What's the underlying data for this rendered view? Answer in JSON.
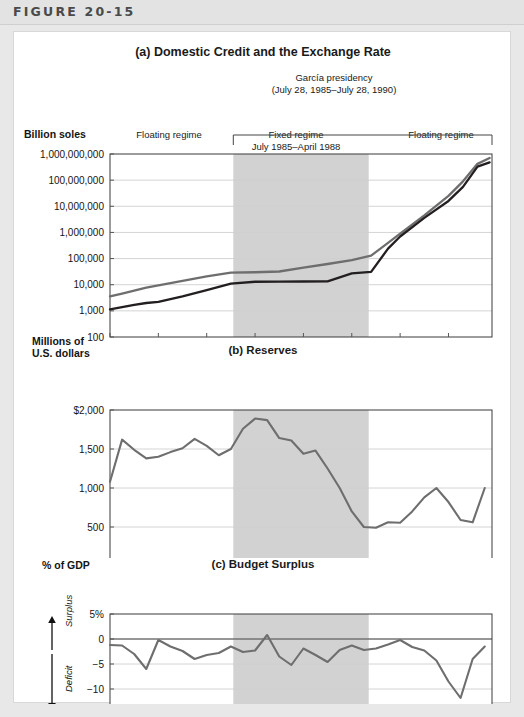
{
  "header": {
    "figure_label": "FIGURE 20-15"
  },
  "panel_a": {
    "title": "(a) Domestic Credit and the Exchange Rate",
    "bracket_note_line1": "García presidency",
    "bracket_note_line2": "(July 28, 1985–July 28, 1990)",
    "y_axis_label": "Billion soles",
    "regime_left": "Floating regime",
    "regime_mid_line1": "Fixed regime",
    "regime_mid_line2": "July 1985–April 1988",
    "regime_mid_line3": "(with some realignments)",
    "regime_right": "Floating regime",
    "series_label_credit": "Domestic credit",
    "series_label_exrate": "Exchange rate (per $)",
    "y_ticks": [
      "1,000,000,000",
      "100,000,000",
      "10,000,000",
      "1,000,000",
      "100,000",
      "10,000",
      "1,000",
      "100"
    ],
    "x_ticks": [
      "1983",
      "1984",
      "1985",
      "1986",
      "1987",
      "1988",
      "1989",
      "1990"
    ]
  },
  "panel_b": {
    "title": "(b) Reserves",
    "y_axis_label_line1": "Millions of",
    "y_axis_label_line2": "U.S. dollars",
    "y_ticks": [
      "$2,000",
      "1,500",
      "1,000",
      "500",
      "0"
    ],
    "x_ticks": [
      "1983",
      "1984",
      "1985",
      "1986",
      "1987",
      "1988",
      "1989",
      "1990"
    ]
  },
  "panel_c": {
    "title": "(c) Budget Surplus",
    "y_axis_label": "% of GDP",
    "surplus_label": "Surplus",
    "deficit_label": "Deficit",
    "y_ticks": [
      "5%",
      "0",
      "−5",
      "−10",
      "−15"
    ],
    "x_ticks": [
      "1983",
      "1984",
      "1985",
      "1986",
      "1987",
      "1988",
      "1989",
      "1990"
    ]
  },
  "colors": {
    "shade_band": "#d2d2d2",
    "line_dark": "#231f20",
    "line_gray": "#6e6e6e",
    "grid": "#cfcfcf",
    "axis": "#3a3a3a",
    "header_text": "#4a4a4a",
    "page_bg": "#e8e8e8"
  },
  "chart_data": [
    {
      "type": "line",
      "id": "panel-a",
      "title": "(a) Domestic Credit and the Exchange Rate",
      "xlabel": "",
      "ylabel": "Billion soles",
      "yscale": "log",
      "ylim": [
        100,
        1000000000
      ],
      "ytick_values": [
        1000000000,
        100000000,
        10000000,
        1000000,
        100000,
        10000,
        1000,
        100
      ],
      "ytick_labels": [
        "1,000,000,000",
        "100,000,000",
        "10,000,000",
        "1,000,000",
        "100,000",
        "10,000",
        "1,000",
        "100"
      ],
      "xlim": [
        1983.0,
        1990.9
      ],
      "xtick_values": [
        1983,
        1984,
        1985,
        1986,
        1987,
        1988,
        1989,
        1990
      ],
      "xtick_labels": [
        "1983",
        "1984",
        "1985",
        "1986",
        "1987",
        "1988",
        "1989",
        "1990"
      ],
      "grid": "horizontal",
      "shaded_span": {
        "label": "Fixed regime",
        "x0": 1985.55,
        "x1": 1988.35,
        "color": "#d2d2d2"
      },
      "annotations": [
        {
          "text": "Floating regime",
          "x": 1984.3,
          "y": 400000000
        },
        {
          "text": "Fixed regime",
          "x": 1986.95,
          "y": 400000000
        },
        {
          "text": "July 1985–April 1988",
          "x": 1986.95,
          "y": 150000000
        },
        {
          "text": "(with some realignments)",
          "x": 1986.95,
          "y": 55000000
        },
        {
          "text": "Floating regime",
          "x": 1989.85,
          "y": 400000000
        },
        {
          "text": "Domestic credit",
          "x": 1986.9,
          "y": 130000
        },
        {
          "text": "Exchange rate (per $)",
          "x": 1986.9,
          "y": 6500
        },
        {
          "text": "García presidency",
          "x": 1987.1,
          "y": 2500000000
        },
        {
          "text": "(July 28, 1985–July 28, 1990)",
          "x": 1987.1,
          "y": 1600000000
        }
      ],
      "series": [
        {
          "name": "Domestic credit",
          "color": "#6e6e6e",
          "x": [
            1983.0,
            1983.25,
            1983.5,
            1983.75,
            1984.0,
            1984.5,
            1985.0,
            1985.5,
            1986.0,
            1986.5,
            1987.0,
            1987.5,
            1988.0,
            1988.4,
            1988.75,
            1989.0,
            1989.5,
            1990.0,
            1990.3,
            1990.6,
            1990.85
          ],
          "y": [
            3600,
            4600,
            6000,
            7800,
            9500,
            14000,
            21000,
            29000,
            30000,
            32000,
            45000,
            62000,
            88000,
            130000,
            400000,
            900000,
            4500000,
            25000000,
            90000000,
            420000000,
            700000000
          ]
        },
        {
          "name": "Exchange rate (per $)",
          "color": "#231f20",
          "x": [
            1983.0,
            1983.25,
            1983.5,
            1983.75,
            1984.0,
            1984.5,
            1985.0,
            1985.5,
            1986.0,
            1986.5,
            1987.0,
            1987.5,
            1988.0,
            1988.4,
            1988.75,
            1989.0,
            1989.5,
            1990.0,
            1990.3,
            1990.6,
            1990.85
          ],
          "y": [
            1150,
            1400,
            1700,
            2000,
            2200,
            3600,
            6200,
            11000,
            13000,
            13200,
            13300,
            13400,
            27000,
            31000,
            240000,
            700000,
            3600000,
            16000000,
            55000000,
            330000000,
            480000000
          ]
        }
      ]
    },
    {
      "type": "line",
      "id": "panel-b",
      "title": "(b) Reserves",
      "xlabel": "",
      "ylabel": "Millions of U.S. dollars",
      "yscale": "linear",
      "ylim": [
        0,
        2000
      ],
      "ytick_values": [
        2000,
        1500,
        1000,
        500,
        0
      ],
      "ytick_labels": [
        "$2,000",
        "1,500",
        "1,000",
        "500",
        "0"
      ],
      "xlim": [
        1983.0,
        1990.9
      ],
      "xtick_values": [
        1983,
        1984,
        1985,
        1986,
        1987,
        1988,
        1989,
        1990
      ],
      "xtick_labels": [
        "1983",
        "1984",
        "1985",
        "1986",
        "1987",
        "1988",
        "1989",
        "1990"
      ],
      "grid": "horizontal",
      "shaded_span": {
        "x0": 1985.55,
        "x1": 1988.35,
        "color": "#d2d2d2"
      },
      "series": [
        {
          "name": "Reserves",
          "color": "#6e6e6e",
          "x": [
            1983.0,
            1983.25,
            1983.5,
            1983.75,
            1984.0,
            1984.25,
            1984.5,
            1984.75,
            1985.0,
            1985.25,
            1985.5,
            1985.75,
            1986.0,
            1986.25,
            1986.5,
            1986.75,
            1987.0,
            1987.25,
            1987.5,
            1987.75,
            1988.0,
            1988.25,
            1988.5,
            1988.75,
            1989.0,
            1989.25,
            1989.5,
            1989.75,
            1990.0,
            1990.25,
            1990.5,
            1990.75
          ],
          "y": [
            1080,
            1620,
            1490,
            1380,
            1400,
            1460,
            1510,
            1630,
            1540,
            1420,
            1500,
            1760,
            1890,
            1870,
            1640,
            1610,
            1440,
            1480,
            1250,
            1000,
            700,
            500,
            490,
            560,
            555,
            700,
            880,
            1000,
            820,
            590,
            560,
            1000,
            1040
          ]
        }
      ]
    },
    {
      "type": "line",
      "id": "panel-c",
      "title": "(c) Budget Surplus",
      "xlabel": "",
      "ylabel": "% of GDP",
      "yscale": "linear",
      "ylim": [
        -15,
        5
      ],
      "ytick_values": [
        5,
        0,
        -5,
        -10,
        -15
      ],
      "ytick_labels": [
        "5%",
        "0",
        "−5",
        "−10",
        "−15"
      ],
      "xlim": [
        1983.0,
        1990.9
      ],
      "xtick_values": [
        1983,
        1984,
        1985,
        1986,
        1987,
        1988,
        1989,
        1990
      ],
      "xtick_labels": [
        "1983",
        "1984",
        "1985",
        "1986",
        "1987",
        "1988",
        "1989",
        "1990"
      ],
      "grid": "horizontal",
      "zero_line": true,
      "shaded_span": {
        "x0": 1985.55,
        "x1": 1988.35,
        "color": "#d2d2d2"
      },
      "axis_annotations": [
        {
          "text": "Surplus",
          "direction": "up"
        },
        {
          "text": "Deficit",
          "direction": "down"
        }
      ],
      "series": [
        {
          "name": "Budget surplus (% of GDP)",
          "color": "#6e6e6e",
          "x": [
            1983.0,
            1983.25,
            1983.5,
            1983.75,
            1984.0,
            1984.25,
            1984.5,
            1984.75,
            1985.0,
            1985.25,
            1985.5,
            1985.75,
            1986.0,
            1986.25,
            1986.5,
            1986.75,
            1987.0,
            1987.25,
            1987.5,
            1987.75,
            1988.0,
            1988.25,
            1988.5,
            1988.75,
            1989.0,
            1989.25,
            1989.5,
            1989.75,
            1990.0,
            1990.25,
            1990.5,
            1990.75
          ],
          "y": [
            -1.2,
            -1.3,
            -3.0,
            -6.0,
            -0.2,
            -1.5,
            -2.4,
            -4.0,
            -3.2,
            -2.8,
            -1.5,
            -2.6,
            -2.3,
            0.8,
            -3.5,
            -5.2,
            -1.9,
            -3.2,
            -4.6,
            -2.2,
            -1.3,
            -2.2,
            -1.9,
            -1.1,
            -0.2,
            -1.6,
            -2.3,
            -4.3,
            -8.5,
            -11.8,
            -4.0,
            -1.5
          ]
        }
      ]
    }
  ]
}
